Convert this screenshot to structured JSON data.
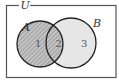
{
  "diagram": {
    "type": "venn",
    "universe_label": "U",
    "sets": [
      {
        "name": "A",
        "shaded": true,
        "style": "hatched"
      },
      {
        "name": "B",
        "shaded": false,
        "style": "light-gray"
      }
    ],
    "regions": [
      {
        "id": "1",
        "label": "1",
        "description": "A only",
        "shaded": true
      },
      {
        "id": "2",
        "label": "2",
        "description": "A and B",
        "shaded": true
      },
      {
        "id": "3",
        "label": "3",
        "description": "B only",
        "shaded": false
      }
    ],
    "colors": {
      "frame": "#555555",
      "circle_stroke": "#222222",
      "a_fill": "#bdbdbd",
      "hatch": "#8a8a8a",
      "b_fill": "#e6e6e6",
      "background": "#ffffff"
    }
  }
}
